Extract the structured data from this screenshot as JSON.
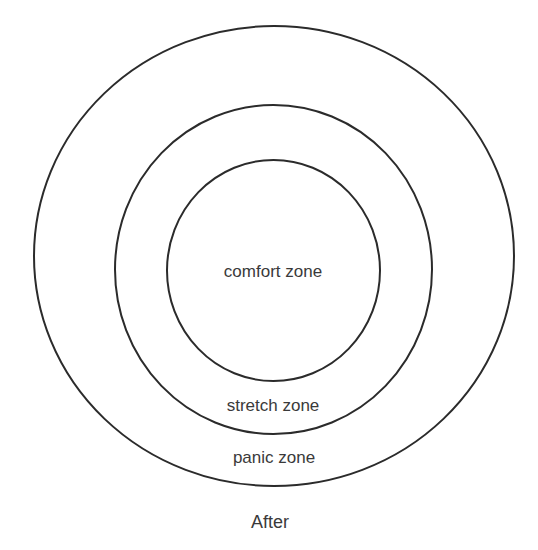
{
  "diagram": {
    "zones": [
      {
        "id": "panic",
        "label": "panic zone"
      },
      {
        "id": "stretch",
        "label": "stretch zone"
      },
      {
        "id": "comfort",
        "label": "comfort zone"
      }
    ],
    "caption": "After",
    "stroke_color": "#2b2b2b",
    "text_color": "#3a3a3a",
    "background": "#ffffff"
  }
}
